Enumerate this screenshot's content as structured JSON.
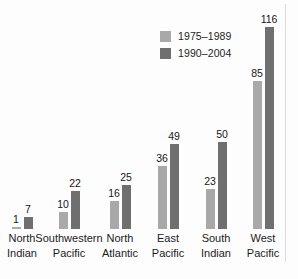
{
  "chart_data": {
    "type": "bar",
    "title": "",
    "subtitle": "",
    "xlabel": "",
    "ylabel": "",
    "ylim": [
      0,
      125
    ],
    "grid": false,
    "legend_position": "top-center",
    "categories": [
      "North Indian",
      "Southwestern Pacific",
      "North Atlantic",
      "East Pacific",
      "South Indian",
      "West Pacific"
    ],
    "category_lines": [
      [
        "North",
        "Indian"
      ],
      [
        "Southwestern",
        "Pacific"
      ],
      [
        "North",
        "Atlantic"
      ],
      [
        "East",
        "Pacific"
      ],
      [
        "South",
        "Indian"
      ],
      [
        "West",
        "Pacific"
      ]
    ],
    "series": [
      {
        "name": "1975–1989",
        "color": "#a9a9a9",
        "values": [
          1,
          10,
          16,
          36,
          23,
          85
        ]
      },
      {
        "name": "1990–2004",
        "color": "#6f6f6f",
        "values": [
          7,
          22,
          25,
          49,
          50,
          116
        ]
      }
    ]
  },
  "legend": {
    "items": [
      {
        "label": "1975–1989",
        "color": "#a9a9a9"
      },
      {
        "label": "1990–2004",
        "color": "#6f6f6f"
      }
    ]
  },
  "colors": {
    "background": "#fdfdfd",
    "series_light": "#a9a9a9",
    "series_dark": "#6f6f6f",
    "text": "#1b1b1b",
    "page_rule": "#dcdcdc"
  }
}
